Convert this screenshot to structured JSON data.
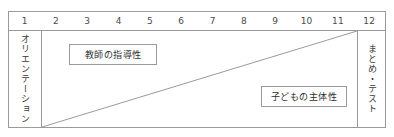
{
  "diagram": {
    "colors": {
      "line": "#9a9a9a",
      "text": "#3a3a3a",
      "background": "#ffffff"
    },
    "timeline": {
      "label": "時間軸",
      "ticks": [
        "1",
        "2",
        "3",
        "4",
        "5",
        "6",
        "7",
        "8",
        "9",
        "10",
        "11",
        "12"
      ]
    },
    "phases": {
      "start": {
        "label": "オリエンテーション",
        "span": "1"
      },
      "end": {
        "label": "まとめ・テスト",
        "span": "12"
      }
    },
    "boxes": [
      {
        "name": "teacher-guidance",
        "label": "教師の指導性"
      },
      {
        "name": "children-initiative",
        "label": "子どもの主体性"
      }
    ],
    "diagonal": {
      "name": "transition-line",
      "description": "bottom-left to top-right diagonal",
      "from": [
        0,
        96
      ],
      "to": [
        315,
        0
      ]
    }
  }
}
